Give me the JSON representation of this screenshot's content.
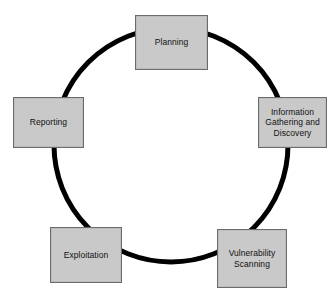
{
  "diagram": {
    "type": "cycle",
    "background_color": "#ffffff",
    "ring": {
      "name": "cycle-ring",
      "center_x": 171,
      "center_y": 145,
      "radius": 117,
      "stroke_width": 5,
      "stroke_color": "#000000",
      "fill": "none"
    },
    "box_style": {
      "fill_color": "#c9c9c9",
      "border_color": "#6b6b6b",
      "text_color": "#111111"
    },
    "stages": [
      {
        "id": "planning",
        "label": "Planning",
        "position": "top",
        "order": 1
      },
      {
        "id": "information",
        "label": "Information\nGathering and\nDiscovery",
        "position": "right",
        "order": 2
      },
      {
        "id": "vulnerability",
        "label": "Vulnerability\nScanning",
        "position": "bottom-right",
        "order": 3
      },
      {
        "id": "exploitation",
        "label": "Exploitation",
        "position": "bottom-left",
        "order": 4
      },
      {
        "id": "reporting",
        "label": "Reporting",
        "position": "left",
        "order": 5
      }
    ]
  }
}
